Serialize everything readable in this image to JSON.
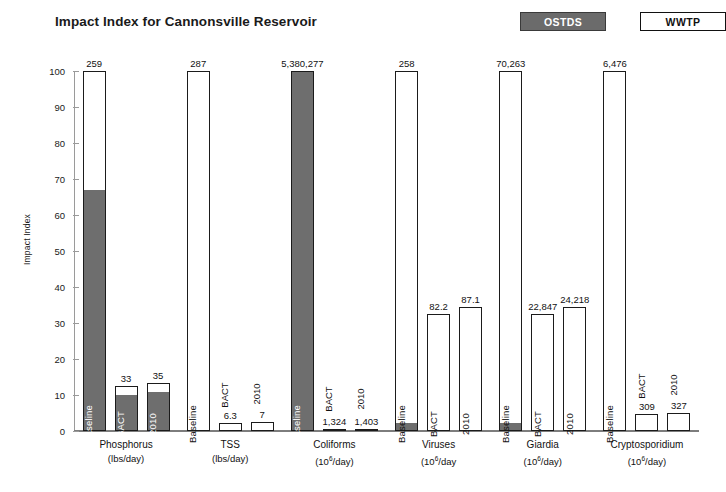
{
  "chart_data": {
    "type": "bar",
    "title": "Impact Index for Cannonsville Reservoir",
    "xlabel": "",
    "ylabel": "Impact Index",
    "ylim": [
      0,
      100
    ],
    "yticks": [
      0,
      10,
      20,
      30,
      40,
      50,
      60,
      70,
      80,
      90,
      100
    ],
    "grid": false,
    "legend_position": "top-right",
    "stacked": true,
    "legend": [
      {
        "name": "OSTDS",
        "color": "#6e6e6e"
      },
      {
        "name": "WWTP",
        "color": "#ffffff"
      }
    ],
    "groups": [
      {
        "category": "Phosphorus",
        "unit_prefix": "(lbs/day)",
        "unit_base": "",
        "unit_exp": "",
        "unit_suffix": "",
        "bars": [
          {
            "scenario": "Baseline",
            "value_label": "259",
            "total_index": 100,
            "ostds": 67,
            "wwtp": 33
          },
          {
            "scenario": "BACT",
            "value_label": "33",
            "total_index": 12.6,
            "ostds": 10.3,
            "wwtp": 2.3
          },
          {
            "scenario": "2010",
            "value_label": "35",
            "total_index": 13.4,
            "ostds": 11.0,
            "wwtp": 2.4
          }
        ]
      },
      {
        "category": "TSS",
        "unit_prefix": "(lbs/day)",
        "unit_base": "",
        "unit_exp": "",
        "unit_suffix": "",
        "bars": [
          {
            "scenario": "Baseline",
            "value_label": "287",
            "total_index": 100,
            "ostds": 0,
            "wwtp": 100
          },
          {
            "scenario": "BACT",
            "value_label": "6.3",
            "total_index": 2.2,
            "ostds": 0,
            "wwtp": 2.2
          },
          {
            "scenario": "2010",
            "value_label": "7",
            "total_index": 2.4,
            "ostds": 0,
            "wwtp": 2.4
          }
        ]
      },
      {
        "category": "Coliforms",
        "unit_prefix": "(10",
        "unit_base": "",
        "unit_exp": "6",
        "unit_suffix": "/day)",
        "bars": [
          {
            "scenario": "Baseline",
            "value_label": "5,380,277",
            "total_index": 100,
            "ostds": 100,
            "wwtp": 0
          },
          {
            "scenario": "BACT",
            "value_label": "1,324",
            "total_index": 0.4,
            "ostds": 0.4,
            "wwtp": 0
          },
          {
            "scenario": "2010",
            "value_label": "1,403",
            "total_index": 0.5,
            "ostds": 0.5,
            "wwtp": 0
          }
        ]
      },
      {
        "category": "Viruses",
        "unit_prefix": "(10",
        "unit_base": "",
        "unit_exp": "6",
        "unit_suffix": "/day",
        "bars": [
          {
            "scenario": "Baseline",
            "value_label": "258",
            "total_index": 100,
            "ostds": 2.0,
            "wwtp": 98.0
          },
          {
            "scenario": "BACT",
            "value_label": "82.2",
            "total_index": 32.5,
            "ostds": 0,
            "wwtp": 32.5
          },
          {
            "scenario": "2010",
            "value_label": "87.1",
            "total_index": 34.5,
            "ostds": 0,
            "wwtp": 34.5
          }
        ]
      },
      {
        "category": "Giardia",
        "unit_prefix": "(10",
        "unit_base": "",
        "unit_exp": "6",
        "unit_suffix": "/day)",
        "bars": [
          {
            "scenario": "Baseline",
            "value_label": "70,263",
            "total_index": 100,
            "ostds": 2.0,
            "wwtp": 98.0
          },
          {
            "scenario": "BACT",
            "value_label": "22,847",
            "total_index": 32.5,
            "ostds": 0,
            "wwtp": 32.5
          },
          {
            "scenario": "2010",
            "value_label": "24,218",
            "total_index": 34.5,
            "ostds": 0,
            "wwtp": 34.5
          }
        ]
      },
      {
        "category": "Cryptosporidium",
        "unit_prefix": "(10",
        "unit_base": "",
        "unit_exp": "6",
        "unit_suffix": "/day)",
        "bars": [
          {
            "scenario": "Baseline",
            "value_label": "6,476",
            "total_index": 100,
            "ostds": 0,
            "wwtp": 100
          },
          {
            "scenario": "BACT",
            "value_label": "309",
            "total_index": 4.8,
            "ostds": 0,
            "wwtp": 4.8
          },
          {
            "scenario": "2010",
            "value_label": "327",
            "total_index": 5.1,
            "ostds": 0,
            "wwtp": 5.1
          }
        ]
      }
    ]
  },
  "colors": {
    "ostds": "#6e6e6e",
    "wwtp": "#ffffff",
    "outline": "#1b1b1b",
    "axis": "#9a9a9a",
    "text": "#111111"
  }
}
